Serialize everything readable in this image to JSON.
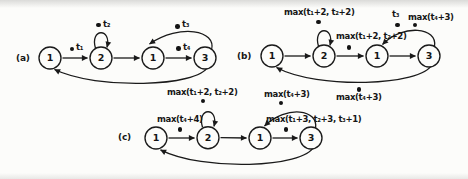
{
  "colors": {
    "ink": "#1a1a1a",
    "background": "#fcfcfa"
  },
  "icons": {
    "token_dot": "filled-circle",
    "arrowhead": "solid-triangle"
  },
  "figures": {
    "a": {
      "tag": "(a)",
      "states": [
        "1",
        "2",
        "1",
        "3"
      ],
      "labels": {
        "t1": "t₁",
        "t2": "t₂",
        "t3": "t₃",
        "t4": "t₄"
      }
    },
    "b": {
      "tag": "(b)",
      "states": [
        "1",
        "2",
        "1",
        "3"
      ],
      "labels": {
        "loop": "max(t₁+2, t₂+2)",
        "mid": "max(t₁+2, t₂+2)",
        "t3": "t₃",
        "top_right": "max(t₄+3)",
        "bottom": "max(t₄+3)"
      }
    },
    "c": {
      "tag": "(c)",
      "states": [
        "1",
        "2",
        "1",
        "3"
      ],
      "labels": {
        "loop": "max(t₁+2, t₂+2)",
        "left": "max(t₄+4)",
        "top_right": "max(t₄+3)",
        "long": "max(t₁+3, t₂+3, t₃+1)"
      }
    }
  }
}
